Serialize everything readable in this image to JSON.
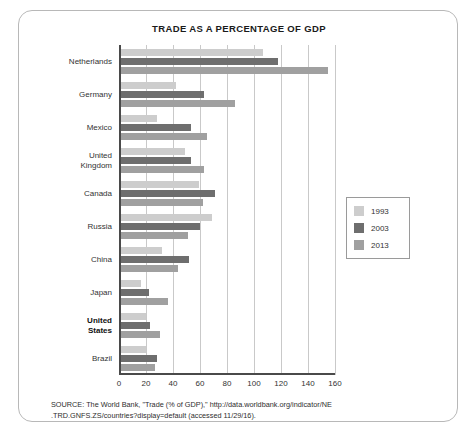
{
  "chart_data": {
    "type": "bar",
    "orientation": "horizontal",
    "title": "TRADE AS A PERCENTAGE OF GDP",
    "xlabel": "",
    "ylabel": "",
    "xlim": [
      0,
      160
    ],
    "xticks": [
      0,
      20,
      40,
      60,
      80,
      100,
      120,
      140,
      160
    ],
    "grid": true,
    "legend_position": "right",
    "categories": [
      "Netherlands",
      "Germany",
      "Mexico",
      "United Kingdom",
      "Canada",
      "Russia",
      "China",
      "Japan",
      "United States",
      "Brazil"
    ],
    "category_labels": [
      {
        "line1": "Netherlands",
        "line2": "",
        "bold": false
      },
      {
        "line1": "Germany",
        "line2": "",
        "bold": false
      },
      {
        "line1": "Mexico",
        "line2": "",
        "bold": false
      },
      {
        "line1": "United",
        "line2": "Kingdom",
        "bold": false
      },
      {
        "line1": "Canada",
        "line2": "",
        "bold": false
      },
      {
        "line1": "Russia",
        "line2": "",
        "bold": false
      },
      {
        "line1": "China",
        "line2": "",
        "bold": false
      },
      {
        "line1": "Japan",
        "line2": "",
        "bold": false
      },
      {
        "line1": "United",
        "line2": "States",
        "bold": true
      },
      {
        "line1": "Brazil",
        "line2": "",
        "bold": false
      }
    ],
    "series": [
      {
        "name": "1993",
        "color": "#cdcdcd",
        "values": [
          107,
          42,
          28,
          49,
          59,
          69,
          32,
          16,
          20,
          20
        ]
      },
      {
        "name": "2003",
        "color": "#6e6e6e",
        "values": [
          118,
          63,
          53,
          53,
          71,
          60,
          52,
          22,
          23,
          28
        ]
      },
      {
        "name": "2013",
        "color": "#a0a0a0",
        "values": [
          155,
          86,
          65,
          63,
          62,
          51,
          44,
          36,
          30,
          27
        ]
      }
    ]
  },
  "legend": {
    "entries": [
      {
        "label": "1993",
        "color": "#cdcdcd"
      },
      {
        "label": "2003",
        "color": "#6e6e6e"
      },
      {
        "label": "2013",
        "color": "#a0a0a0"
      }
    ]
  },
  "source_note": {
    "line1": "SOURCE: The World Bank, \"Trade (% of GDP),\" http://data.worldbank.org/indicator/NE",
    "line2": ".TRD.GNFS.ZS/countries?display=default (accessed 11/29/16)."
  }
}
